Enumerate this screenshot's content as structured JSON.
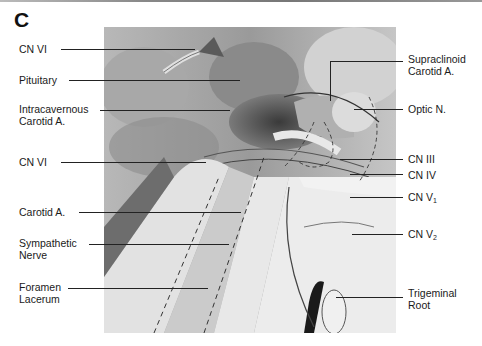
{
  "figure": {
    "panel_letter": "C",
    "left_labels": [
      {
        "id": "cn-vi-top",
        "lines": [
          "CN VI"
        ]
      },
      {
        "id": "pituitary",
        "lines": [
          "Pituitary"
        ]
      },
      {
        "id": "intracavernous-carotid",
        "lines": [
          "Intracavernous",
          "Carotid  A."
        ]
      },
      {
        "id": "cn-vi-mid",
        "lines": [
          "CN VI"
        ]
      },
      {
        "id": "carotid-a",
        "lines": [
          "Carotid  A."
        ]
      },
      {
        "id": "sympathetic-nerve",
        "lines": [
          "Sympathetic",
          "Nerve"
        ]
      },
      {
        "id": "foramen-lacerum",
        "lines": [
          "Foramen",
          "Lacerum"
        ]
      }
    ],
    "right_labels": [
      {
        "id": "supraclinoid-carotid",
        "lines": [
          "Supraclinoid",
          "Carotid  A."
        ]
      },
      {
        "id": "optic-n",
        "lines": [
          "Optic  N."
        ]
      },
      {
        "id": "cn-iii",
        "lines": [
          "CN  III"
        ]
      },
      {
        "id": "cn-iv",
        "lines": [
          "CN  IV"
        ]
      },
      {
        "id": "cn-v1",
        "text": "CN  V",
        "sub": "1"
      },
      {
        "id": "cn-v2",
        "text": "CN  V",
        "sub": "2"
      },
      {
        "id": "trigeminal-root",
        "lines": [
          "Trigeminal",
          "Root"
        ]
      }
    ],
    "colors": {
      "background": "#ffffff",
      "text": "#1a1a1a",
      "leader": "#222222"
    }
  }
}
